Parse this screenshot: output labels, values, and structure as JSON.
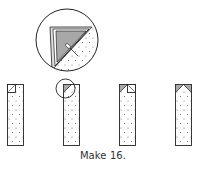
{
  "caption": "Make 16.",
  "colors": {
    "stroke": "#222222",
    "fabric": "#ffffff",
    "dot": "#555555",
    "corner_fill": "#a8a8a8",
    "corner_fill_light": "#d8d8d8"
  },
  "diagram": {
    "detail_view": "magnified corner showing folded square and stitching line",
    "strips": [
      {
        "step": 1,
        "corners": [
          "top-left square placed"
        ]
      },
      {
        "step": 2,
        "corners": [
          "top-left stitched and pressed"
        ],
        "highlighted": true
      },
      {
        "step": 3,
        "corners": [
          "top-left pressed",
          "top-right square placed"
        ]
      },
      {
        "step": 4,
        "corners": [
          "top-left pressed",
          "top-right pressed"
        ]
      }
    ]
  }
}
